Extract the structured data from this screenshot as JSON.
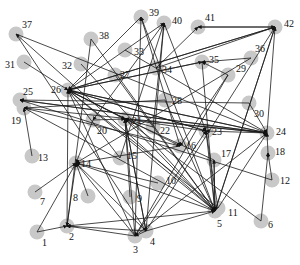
{
  "diagram": {
    "type": "directed-network",
    "node_color": "#c8c8c8",
    "edge_color": "#1a1a1a",
    "nodes": [
      {
        "id": "1",
        "x": 37,
        "y": 232,
        "lx": 42,
        "ly": 246
      },
      {
        "id": "2",
        "x": 67,
        "y": 226,
        "lx": 69,
        "ly": 240
      },
      {
        "id": "3",
        "x": 135,
        "y": 236,
        "lx": 133,
        "ly": 253
      },
      {
        "id": "4",
        "x": 146,
        "y": 231,
        "lx": 150,
        "ly": 245
      },
      {
        "id": "5",
        "x": 215,
        "y": 211,
        "lx": 217,
        "ly": 227
      },
      {
        "id": "6",
        "x": 261,
        "y": 221,
        "lx": 268,
        "ly": 228
      },
      {
        "id": "7",
        "x": 35,
        "y": 192,
        "lx": 40,
        "ly": 205
      },
      {
        "id": "8",
        "x": 88,
        "y": 196,
        "lx": 73,
        "ly": 201
      },
      {
        "id": "9",
        "x": 130,
        "y": 197,
        "lx": 137,
        "ly": 202
      },
      {
        "id": "10",
        "x": 158,
        "y": 183,
        "lx": 166,
        "ly": 184
      },
      {
        "id": "11",
        "x": 218,
        "y": 208,
        "lx": 228,
        "ly": 216
      },
      {
        "id": "12",
        "x": 272,
        "y": 180,
        "lx": 280,
        "ly": 184
      },
      {
        "id": "13",
        "x": 32,
        "y": 156,
        "lx": 38,
        "ly": 161
      },
      {
        "id": "14",
        "x": 76,
        "y": 163,
        "lx": 81,
        "ly": 167
      },
      {
        "id": "15",
        "x": 120,
        "y": 158,
        "lx": 127,
        "ly": 159
      },
      {
        "id": "16",
        "x": 180,
        "y": 146,
        "lx": 186,
        "ly": 149
      },
      {
        "id": "17",
        "x": 214,
        "y": 160,
        "lx": 221,
        "ly": 157
      },
      {
        "id": "18",
        "x": 268,
        "y": 153,
        "lx": 275,
        "ly": 155
      },
      {
        "id": "19",
        "x": 24,
        "y": 108,
        "lx": 11,
        "ly": 124
      },
      {
        "id": "20",
        "x": 93,
        "y": 120,
        "lx": 97,
        "ly": 134
      },
      {
        "id": "21",
        "x": 125,
        "y": 119,
        "lx": 132,
        "ly": 124
      },
      {
        "id": "22",
        "x": 153,
        "y": 127,
        "lx": 160,
        "ly": 134
      },
      {
        "id": "23",
        "x": 206,
        "y": 131,
        "lx": 212,
        "ly": 135
      },
      {
        "id": "24",
        "x": 267,
        "y": 133,
        "lx": 276,
        "ly": 135
      },
      {
        "id": "25",
        "x": 20,
        "y": 100,
        "lx": 23,
        "ly": 95
      },
      {
        "id": "26",
        "x": 68,
        "y": 90,
        "lx": 51,
        "ly": 93
      },
      {
        "id": "27",
        "x": 115,
        "y": 75,
        "lx": 120,
        "ly": 78
      },
      {
        "id": "28",
        "x": 165,
        "y": 100,
        "lx": 172,
        "ly": 104
      },
      {
        "id": "29",
        "x": 228,
        "y": 75,
        "lx": 236,
        "ly": 72
      },
      {
        "id": "30",
        "x": 249,
        "y": 103,
        "lx": 254,
        "ly": 117
      },
      {
        "id": "31",
        "x": 24,
        "y": 62,
        "lx": 5,
        "ly": 68
      },
      {
        "id": "32",
        "x": 81,
        "y": 64,
        "lx": 62,
        "ly": 69
      },
      {
        "id": "33",
        "x": 125,
        "y": 50,
        "lx": 134,
        "ly": 55
      },
      {
        "id": "34",
        "x": 156,
        "y": 68,
        "lx": 162,
        "ly": 73
      },
      {
        "id": "35",
        "x": 202,
        "y": 62,
        "lx": 209,
        "ly": 63
      },
      {
        "id": "36",
        "x": 251,
        "y": 58,
        "lx": 255,
        "ly": 52
      },
      {
        "id": "37",
        "x": 16,
        "y": 34,
        "lx": 22,
        "ly": 28
      },
      {
        "id": "38",
        "x": 91,
        "y": 39,
        "lx": 99,
        "ly": 39
      },
      {
        "id": "39",
        "x": 141,
        "y": 17,
        "lx": 149,
        "ly": 16
      },
      {
        "id": "40",
        "x": 164,
        "y": 23,
        "lx": 172,
        "ly": 24
      },
      {
        "id": "41",
        "x": 198,
        "y": 27,
        "lx": 205,
        "ly": 21
      },
      {
        "id": "42",
        "x": 275,
        "y": 27,
        "lx": 284,
        "ly": 27
      }
    ],
    "edges": [
      [
        "1",
        "2"
      ],
      [
        "1",
        "14"
      ],
      [
        "7",
        "14"
      ],
      [
        "13",
        "19"
      ],
      [
        "2",
        "14"
      ],
      [
        "2",
        "26"
      ],
      [
        "3",
        "2"
      ],
      [
        "3",
        "14"
      ],
      [
        "3",
        "21"
      ],
      [
        "3",
        "23"
      ],
      [
        "3",
        "24"
      ],
      [
        "3",
        "26"
      ],
      [
        "3",
        "39"
      ],
      [
        "4",
        "2"
      ],
      [
        "4",
        "5"
      ],
      [
        "4",
        "14"
      ],
      [
        "4",
        "21"
      ],
      [
        "4",
        "42"
      ],
      [
        "4",
        "40"
      ],
      [
        "4",
        "3"
      ],
      [
        "5",
        "2"
      ],
      [
        "5",
        "21"
      ],
      [
        "5",
        "26"
      ],
      [
        "5",
        "39"
      ],
      [
        "5",
        "42"
      ],
      [
        "5",
        "14"
      ],
      [
        "5",
        "37"
      ],
      [
        "5",
        "17"
      ],
      [
        "6",
        "18"
      ],
      [
        "6",
        "21"
      ],
      [
        "8",
        "14"
      ],
      [
        "9",
        "21"
      ],
      [
        "10",
        "14"
      ],
      [
        "11",
        "26"
      ],
      [
        "11",
        "24"
      ],
      [
        "11",
        "23"
      ],
      [
        "12",
        "18"
      ],
      [
        "12",
        "25"
      ],
      [
        "15",
        "26"
      ],
      [
        "15",
        "40"
      ],
      [
        "16",
        "14"
      ],
      [
        "16",
        "26"
      ],
      [
        "17",
        "21"
      ],
      [
        "17",
        "5"
      ],
      [
        "18",
        "24"
      ],
      [
        "19",
        "24"
      ],
      [
        "19",
        "16"
      ],
      [
        "19",
        "5"
      ],
      [
        "20",
        "21"
      ],
      [
        "21",
        "26"
      ],
      [
        "22",
        "21"
      ],
      [
        "22",
        "40"
      ],
      [
        "23",
        "26"
      ],
      [
        "23",
        "5"
      ],
      [
        "23",
        "21"
      ],
      [
        "24",
        "26"
      ],
      [
        "24",
        "21"
      ],
      [
        "24",
        "23"
      ],
      [
        "24",
        "25"
      ],
      [
        "24",
        "42"
      ],
      [
        "25",
        "24"
      ],
      [
        "26",
        "24"
      ],
      [
        "26",
        "21"
      ],
      [
        "26",
        "23"
      ],
      [
        "26",
        "42"
      ],
      [
        "26",
        "35"
      ],
      [
        "26",
        "40"
      ],
      [
        "27",
        "5"
      ],
      [
        "28",
        "19"
      ],
      [
        "28",
        "5"
      ],
      [
        "29",
        "3"
      ],
      [
        "29",
        "16"
      ],
      [
        "29",
        "35"
      ],
      [
        "30",
        "24"
      ],
      [
        "30",
        "25"
      ],
      [
        "31",
        "26"
      ],
      [
        "32",
        "5"
      ],
      [
        "33",
        "24"
      ],
      [
        "34",
        "42"
      ],
      [
        "34",
        "41"
      ],
      [
        "35",
        "26"
      ],
      [
        "35",
        "5"
      ],
      [
        "36",
        "14"
      ],
      [
        "36",
        "35"
      ],
      [
        "37",
        "24"
      ],
      [
        "37",
        "4"
      ],
      [
        "38",
        "5"
      ],
      [
        "38",
        "2"
      ],
      [
        "39",
        "26"
      ],
      [
        "39",
        "16"
      ],
      [
        "40",
        "20"
      ],
      [
        "40",
        "23"
      ],
      [
        "41",
        "42"
      ],
      [
        "42",
        "41"
      ],
      [
        "42",
        "26"
      ],
      [
        "42",
        "5"
      ],
      [
        "20",
        "14"
      ],
      [
        "21",
        "4"
      ]
    ]
  }
}
